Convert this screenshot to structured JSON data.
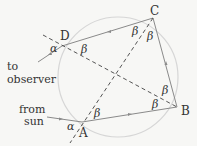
{
  "diagram": {
    "points": {
      "A": {
        "label": "A",
        "x": 82,
        "y": 122
      },
      "B": {
        "label": "B",
        "x": 177,
        "y": 107
      },
      "C": {
        "label": "C",
        "x": 153,
        "y": 18
      },
      "D": {
        "label": "D",
        "x": 62,
        "y": 46
      }
    },
    "circle": {
      "cx": 118,
      "cy": 77,
      "r": 60,
      "color": "#d6d6d6"
    },
    "angle_labels": {
      "alpha": "α",
      "beta": "β"
    },
    "side_labels": {
      "to_observer_line1": "to",
      "to_observer_line2": "observer",
      "from_sun_line1": "from",
      "from_sun_line2": "sun"
    },
    "colors": {
      "ray": "#8a8a8a",
      "dashed": "#555555",
      "text": "#333333",
      "background": "#f7f7f5"
    }
  }
}
